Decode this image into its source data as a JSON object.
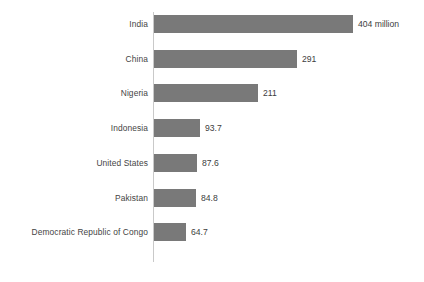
{
  "chart_data": {
    "type": "bar",
    "orientation": "horizontal",
    "title": "",
    "subtitle": "",
    "xlabel": "",
    "ylabel": "",
    "unit": "million",
    "grid": false,
    "legend": false,
    "axis_line": true,
    "tick_labels": [],
    "xlim": [
      0,
      404
    ],
    "categories": [
      "India",
      "China",
      "Nigeria",
      "Indonesia",
      "United States",
      "Pakistan",
      "Democratic Republic of Congo"
    ],
    "values": [
      404,
      291,
      211,
      93.7,
      87.6,
      84.8,
      64.7
    ],
    "data_labels": [
      "404 million",
      "291",
      "211",
      "93.7",
      "87.6",
      "84.8",
      "64.7"
    ],
    "bars": [
      {
        "category": "India",
        "value": 404,
        "label": "404 million"
      },
      {
        "category": "China",
        "value": 291,
        "label": "291"
      },
      {
        "category": "Nigeria",
        "value": 211,
        "label": "211"
      },
      {
        "category": "Indonesia",
        "value": 93.7,
        "label": "93.7"
      },
      {
        "category": "United States",
        "value": 87.6,
        "label": "87.6"
      },
      {
        "category": "Pakistan",
        "value": 84.8,
        "label": "84.8"
      },
      {
        "category": "Democratic Republic of Congo",
        "value": 64.7,
        "label": "64.7"
      }
    ]
  },
  "colors": {
    "bar": "#797979",
    "axis": "#c9c9c9",
    "label_text": "#444444",
    "value_text": "#3d3d3d",
    "background": "#ffffff"
  }
}
